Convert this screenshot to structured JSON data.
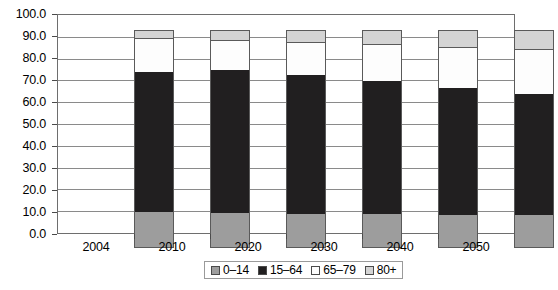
{
  "chart_data": {
    "type": "bar",
    "subtype": "stacked-column-100",
    "title": "",
    "subtitle": "",
    "xlabel": "",
    "ylabel": "",
    "categories": [
      "2004",
      "2010",
      "2020",
      "2030",
      "2040",
      "2050"
    ],
    "series": [
      {
        "name": "0–14",
        "color": "#9d9d9d",
        "values": [
          16.5,
          16.1,
          15.8,
          15.5,
          15.2,
          15.1
        ]
      },
      {
        "name": "15–64",
        "color": "#211f20",
        "values": [
          64.2,
          65.4,
          63.7,
          61.0,
          58.3,
          55.4
        ]
      },
      {
        "name": "65–79",
        "color": "#fdfdfd",
        "values": [
          15.3,
          13.5,
          14.5,
          16.5,
          18.3,
          20.4
        ]
      },
      {
        "name": "80+",
        "color": "#d4d4d4",
        "values": [
          4.0,
          5.0,
          6.0,
          7.0,
          8.2,
          9.1
        ]
      }
    ],
    "ylim": [
      0,
      100
    ],
    "ytick_step": 10,
    "ytick_labels": [
      "0.0",
      "10.0",
      "20.0",
      "30.0",
      "40.0",
      "50.0",
      "60.0",
      "70.0",
      "80.0",
      "90.0",
      "100.0"
    ],
    "ytick_values": [
      0,
      10,
      20,
      30,
      40,
      50,
      60,
      70,
      80,
      90,
      100
    ],
    "grid": true,
    "grid_axis": "y",
    "legend_position": "bottom",
    "legend_entries": [
      "0–14",
      "15–64",
      "65–79",
      "80+"
    ],
    "annotations": []
  },
  "style": {
    "background": "#ffffff",
    "frame_color": "#6e6e6e",
    "gridline_color": "#8a8a8a",
    "text_color": "#000000"
  }
}
